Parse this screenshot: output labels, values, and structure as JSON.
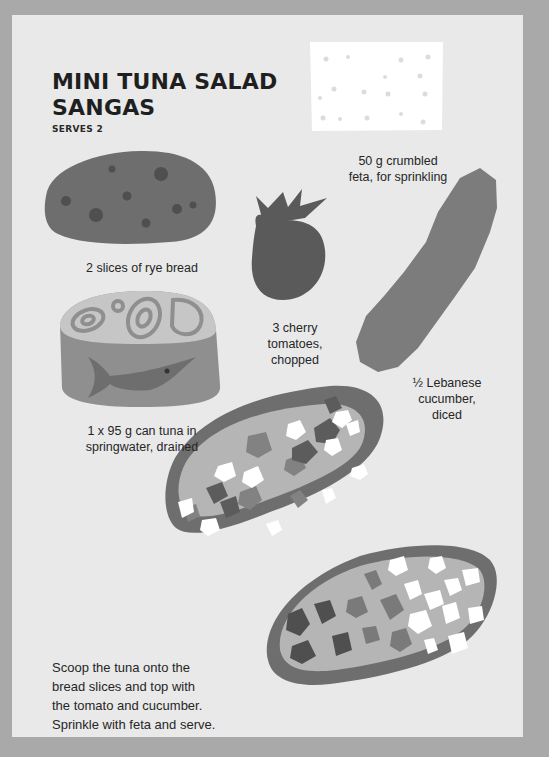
{
  "recipe": {
    "title_line1": "MINI TUNA SALAD",
    "title_line2": "SANGAS",
    "serves": "SERVES 2"
  },
  "ingredients": [
    {
      "name": "rye-bread",
      "label_line1": "2 slices of rye bread",
      "illustration": "rye-bread-slice-icon"
    },
    {
      "name": "feta",
      "label_line1": "50 g crumbled",
      "label_line2": "feta, for sprinkling",
      "illustration": "feta-block-icon"
    },
    {
      "name": "tomato",
      "label_line1": "3 cherry",
      "label_line2": "tomatoes,",
      "label_line3": "chopped",
      "illustration": "cherry-tomato-icon"
    },
    {
      "name": "cucumber",
      "label_line1": "½ Lebanese",
      "label_line2": "cucumber,",
      "label_line3": "diced",
      "illustration": "cucumber-icon"
    },
    {
      "name": "tuna",
      "label_line1": "1 x 95 g can tuna in",
      "label_line2": "springwater, drained",
      "illustration": "tuna-can-icon"
    }
  ],
  "method": {
    "line1": "Scoop the tuna onto the",
    "line2": "bread slices and top with",
    "line3": "the tomato and cucumber.",
    "line4": "Sprinkle with feta and serve."
  },
  "colors": {
    "border": "#a9a9a9",
    "page": "#e9e9e9",
    "bread": "#6e6e6e",
    "bread_seed": "#4f4f4f",
    "tuna_spread": "#b5b5b5",
    "tomato": "#5a5a5a",
    "cucumber": "#7c7c7c",
    "feta": "#ffffff"
  }
}
